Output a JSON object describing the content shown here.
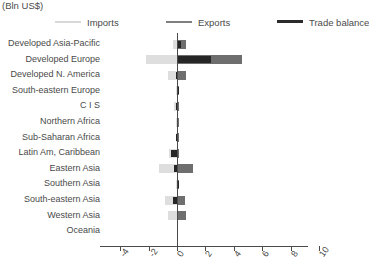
{
  "chart_data": {
    "type": "bar",
    "orientation": "horizontal",
    "title": "",
    "subtitle": "",
    "unit_label": "(Bln US$)",
    "xlabel": "",
    "ylabel": "",
    "xlim": [
      -5.0,
      10.5
    ],
    "grid": false,
    "legend_position": "top",
    "categories": [
      "Developed Asia-Pacific",
      "Developed Europe",
      "Developed N. America",
      "South-eastern Europe",
      "C I S",
      "Northern Africa",
      "Sub-Saharan Africa",
      "Latin Am, Caribbean",
      "Eastern Asia",
      "Southern Asia",
      "South-eastern Asia",
      "Western Asia",
      "Oceania"
    ],
    "series": [
      {
        "name": "Imports",
        "color": "#dedede",
        "values": [
          -0.3,
          -2.2,
          -0.65,
          -0.05,
          -0.2,
          -0.05,
          -0.1,
          -0.55,
          -1.3,
          -0.1,
          -0.85,
          -0.6,
          0.0
        ]
      },
      {
        "name": "Exports",
        "color": "#6e6e6e",
        "values": [
          0.6,
          4.6,
          0.6,
          0.05,
          0.1,
          0.05,
          0.05,
          0.1,
          1.1,
          0.15,
          0.55,
          0.6,
          0.0
        ]
      },
      {
        "name": "Trade balance",
        "color": "#262626",
        "values": [
          0.3,
          2.4,
          -0.05,
          0.03,
          -0.1,
          0.0,
          -0.05,
          -0.45,
          -0.2,
          0.05,
          -0.3,
          0.0,
          0.0
        ]
      }
    ],
    "xticks": [
      -4,
      -2,
      0,
      2,
      4,
      6,
      8,
      10
    ],
    "xtick_labels": [
      "-4",
      "-2",
      "0",
      "2",
      "4",
      "6",
      "8",
      "10"
    ],
    "colors": {
      "imports": "#dedede",
      "exports": "#6e6e6e",
      "trade_balance": "#262626",
      "axis": "#4a4a4a",
      "text": "#4a4a4a",
      "background": "#ffffff"
    }
  },
  "legend": {
    "imports_label": "Imports",
    "exports_label": "Exports",
    "balance_label": "Trade balance"
  }
}
